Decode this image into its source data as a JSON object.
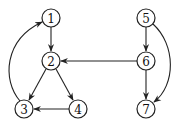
{
  "diagram": {
    "type": "directed-graph",
    "nodes": [
      {
        "id": "1",
        "label": "1",
        "x": 51,
        "y": 18
      },
      {
        "id": "2",
        "label": "2",
        "x": 51,
        "y": 61
      },
      {
        "id": "3",
        "label": "3",
        "x": 24,
        "y": 109
      },
      {
        "id": "4",
        "label": "4",
        "x": 78,
        "y": 109
      },
      {
        "id": "5",
        "label": "5",
        "x": 146,
        "y": 18
      },
      {
        "id": "6",
        "label": "6",
        "x": 146,
        "y": 61
      },
      {
        "id": "7",
        "label": "7",
        "x": 146,
        "y": 109
      }
    ],
    "edges": [
      {
        "from": "1",
        "to": "2"
      },
      {
        "from": "2",
        "to": "3"
      },
      {
        "from": "2",
        "to": "4"
      },
      {
        "from": "4",
        "to": "3"
      },
      {
        "from": "3",
        "to": "1",
        "curved": true
      },
      {
        "from": "6",
        "to": "2"
      },
      {
        "from": "5",
        "to": "6"
      },
      {
        "from": "6",
        "to": "7"
      },
      {
        "from": "5",
        "to": "7",
        "curved": true
      }
    ],
    "colors": {
      "stroke": "#222222",
      "background": "#ffffff"
    }
  }
}
